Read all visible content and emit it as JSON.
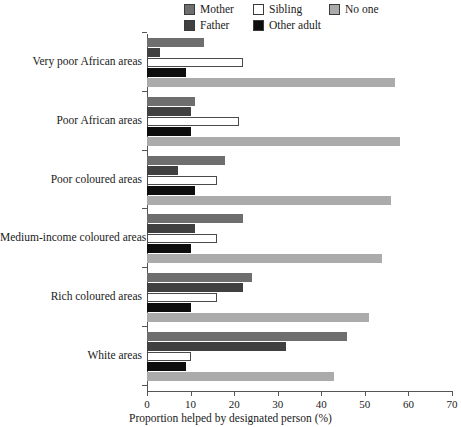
{
  "chart_data": {
    "type": "bar",
    "orientation": "horizontal",
    "title": "",
    "xlabel": "Proportion helped by designated person (%)",
    "ylabel": "",
    "xlim": [
      0,
      70
    ],
    "xticks": [
      0,
      10,
      20,
      30,
      40,
      50,
      60,
      70
    ],
    "grid": false,
    "legend_position": "top",
    "categories": [
      "Very poor African areas",
      "Poor African areas",
      "Poor coloured areas",
      "Medium-income coloured areas",
      "Rich coloured areas",
      "White areas"
    ],
    "series": [
      {
        "name": "Mother",
        "color": "#6e6e6e",
        "values": [
          13,
          11,
          18,
          22,
          24,
          46
        ]
      },
      {
        "name": "Father",
        "color": "#404040",
        "values": [
          3,
          10,
          7,
          11,
          22,
          32
        ]
      },
      {
        "name": "Sibling",
        "color": "#ffffff",
        "values": [
          22,
          21,
          16,
          16,
          16,
          10
        ]
      },
      {
        "name": "Other adult",
        "color": "#0d0d0d",
        "values": [
          9,
          10,
          11,
          10,
          10,
          9
        ]
      },
      {
        "name": "No one",
        "color": "#ababab",
        "values": [
          57,
          58,
          56,
          54,
          51,
          43
        ]
      }
    ]
  },
  "legend": {
    "items": [
      {
        "label": "Mother",
        "color": "#6e6e6e"
      },
      {
        "label": "Father",
        "color": "#404040"
      },
      {
        "label": "Sibling",
        "color": "#ffffff"
      },
      {
        "label": "Other adult",
        "color": "#0d0d0d"
      },
      {
        "label": "No one",
        "color": "#ababab"
      }
    ]
  },
  "axis": {
    "x_title": "Proportion helped by designated person (%)",
    "x_tick_labels": [
      "0",
      "10",
      "20",
      "30",
      "40",
      "50",
      "60",
      "70"
    ]
  }
}
